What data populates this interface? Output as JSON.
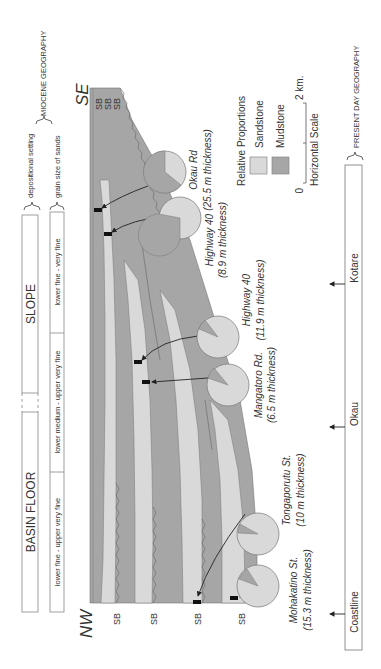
{
  "header": {
    "bracket_top_label": "depositional setting",
    "bracket_bottom_label": "grain size of sands",
    "group_label": "MIOCENE GEOGRAPHY"
  },
  "depositional_setting": [
    {
      "label": "BASIN FLOOR"
    },
    {
      "label": "SLOPE"
    }
  ],
  "grain_size": [
    {
      "label": "lower fine - upper very fine"
    },
    {
      "label": "lower medium - upper very fine"
    },
    {
      "label": "lower fine - very fine"
    }
  ],
  "orientation": {
    "left": "NW",
    "right": "SE"
  },
  "sequence_boundaries": {
    "nw_labels": [
      "SB",
      "SB",
      "SB",
      "SB"
    ],
    "se_labels": [
      "SB",
      "SB",
      "SB"
    ]
  },
  "sections": [
    {
      "name": "Okau Rd",
      "thickness": "(25.5 m thickness)",
      "mudstone_pct": 62,
      "sandstone_pct": 38
    },
    {
      "name": "Highway 40",
      "thickness": "(8.9 m thickness)",
      "mudstone_pct": 72,
      "sandstone_pct": 28
    },
    {
      "name": "Highway 40",
      "thickness": "(11.9 m thickness)",
      "mudstone_pct": 14,
      "sandstone_pct": 86
    },
    {
      "name": "Mangatoro Rd.",
      "thickness": "(6.5 m thickness)",
      "mudstone_pct": 15,
      "sandstone_pct": 85
    },
    {
      "name": "Tongaporutu St.",
      "thickness": "(10 m thickness)",
      "mudstone_pct": 8,
      "sandstone_pct": 92
    },
    {
      "name": "Mohakatino St.",
      "thickness": "(15.3 m thickness)",
      "mudstone_pct": 13,
      "sandstone_pct": 87
    }
  ],
  "legend": {
    "title": "Relative Proportions",
    "items": [
      {
        "label": "Sandstone",
        "color": "#d9d9d9"
      },
      {
        "label": "Mudstone",
        "color": "#a6a6a6"
      }
    ],
    "scale": {
      "start": "0",
      "end": "2 km.",
      "label": "Horizontal Scale"
    }
  },
  "present_day": {
    "group_label": "PRESENT DAY GEOGRAPHY",
    "locations": [
      "Coastline",
      "Okau",
      "Kotare"
    ]
  },
  "colors": {
    "sandstone": "#d9d9d9",
    "mudstone": "#a6a6a6",
    "outline": "#555555"
  }
}
